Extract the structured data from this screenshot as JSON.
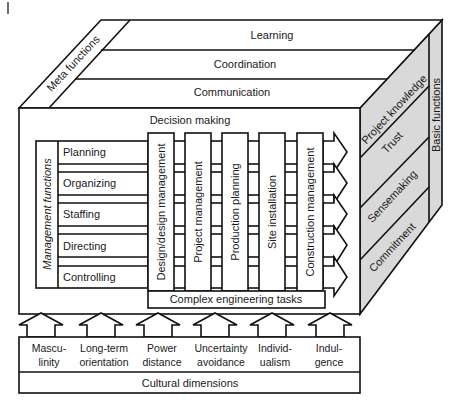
{
  "diagram": {
    "colors": {
      "line": "#111111",
      "fill": "#ffffff",
      "side_fill": "#d9d9d9"
    },
    "top_face": {
      "side_label": "Meta functions",
      "layers": [
        "Learning",
        "Coordination",
        "Communication"
      ]
    },
    "front_face": {
      "title": "Decision making",
      "management_functions": {
        "label": "Management functions",
        "items": [
          "Planning",
          "Organizing",
          "Staffing",
          "Directing",
          "Controlling"
        ]
      },
      "engineering_columns": [
        "Design/design management",
        "Project management",
        "Production planning",
        "Site installation",
        "Construction management"
      ],
      "base_bar": "Complex engineering tasks"
    },
    "right_face": {
      "side_label": "Basic functions",
      "layers": [
        "Project knowledge",
        "Trust",
        "Sensemaking",
        "Commitment"
      ]
    },
    "bottom": {
      "cultural_dimensions": [
        {
          "line1": "Mascu-",
          "line2": "linity"
        },
        {
          "line1": "Long-term",
          "line2": "orientation"
        },
        {
          "line1": "Power",
          "line2": "distance"
        },
        {
          "line1": "Uncertainty",
          "line2": "avoidance"
        },
        {
          "line1": "Individ-",
          "line2": "ualism"
        },
        {
          "line1": "Indul-",
          "line2": "gence"
        }
      ],
      "footer": "Cultural dimensions"
    }
  }
}
